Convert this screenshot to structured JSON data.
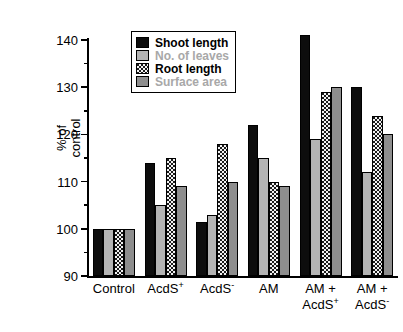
{
  "chart_data": {
    "type": "bar",
    "title": "",
    "xlabel": "",
    "ylabel": "% of\ncontrol",
    "ylim": [
      90,
      140
    ],
    "ytick_values": [
      90,
      100,
      110,
      120,
      130,
      140
    ],
    "ytick_labels": [
      "90",
      "100",
      "110",
      "120",
      "130",
      "140"
    ],
    "minor_ticks": [
      95,
      105,
      115,
      125,
      135
    ],
    "grid": false,
    "legend_position": "upper-left-inside",
    "categories": [
      "Control",
      "AcdS⁺",
      "AcdS⁻",
      "AM",
      "AM +\nAcdS⁺",
      "AM +\nAcdS⁻"
    ],
    "category_labels_html": [
      "Control",
      "AcdS<sup>+</sup>",
      "AcdS<sup>-</sup>",
      "AM",
      "AM +<br>AcdS<sup>+</sup>",
      "AM +<br>AcdS<sup>-</sup>"
    ],
    "series": [
      {
        "name": "Shoot length",
        "fill": "solid-black",
        "color": "#0d0d0d",
        "values": [
          100,
          114,
          101.5,
          122,
          141,
          130
        ]
      },
      {
        "name": "No. of leaves",
        "fill": "light-gray",
        "color": "#b4b4b4",
        "values": [
          100,
          105,
          103,
          115,
          119,
          112
        ]
      },
      {
        "name": "Root length",
        "fill": "checkered",
        "color": "#1a1a1a",
        "values": [
          100,
          115,
          118,
          110,
          129,
          124
        ]
      },
      {
        "name": "Surface area",
        "fill": "mid-gray",
        "color": "#8e8e8e",
        "values": [
          100,
          109,
          110,
          109,
          130,
          120
        ]
      }
    ]
  },
  "legend": {
    "items": [
      {
        "label": "Shoot length",
        "fill": "solid-black",
        "muted": false
      },
      {
        "label": "No. of leaves",
        "fill": "light-gray",
        "muted": true
      },
      {
        "label": "Root length",
        "fill": "checkered",
        "muted": false
      },
      {
        "label": "Surface area",
        "fill": "mid-gray",
        "muted": true
      }
    ]
  },
  "axes": {
    "y_axis_title": "% of\ncontrol"
  }
}
